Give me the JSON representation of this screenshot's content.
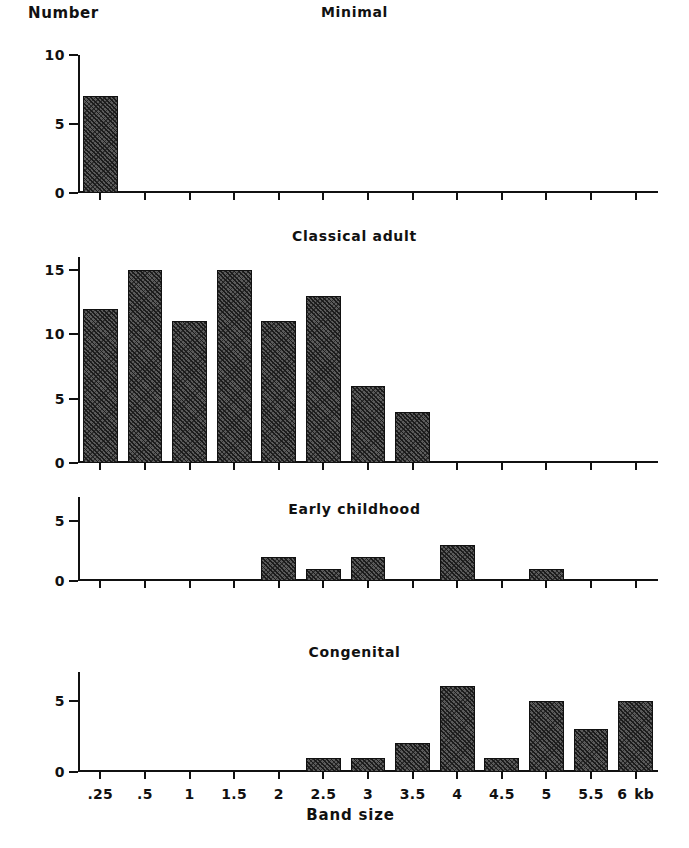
{
  "figure": {
    "y_axis_title": "Number",
    "x_axis_title": "Band size",
    "x_unit": "kb"
  },
  "chart_data": {
    "type": "bar",
    "xlabel": "Band size",
    "ylabel": "Number",
    "x_unit": "kb",
    "grid": false,
    "legend": "none",
    "categories": [
      ".25",
      ".5",
      "1",
      "1.5",
      "2",
      "2.5",
      "3",
      "3.5",
      "4",
      "4.5",
      "5",
      "5.5",
      "6"
    ],
    "panels": [
      {
        "title": "Minimal",
        "ylim": [
          0,
          10
        ],
        "yticks": [
          0,
          5,
          10
        ],
        "ytick_labels": [
          "0",
          "5",
          "10"
        ],
        "values": [
          7,
          0,
          0,
          0,
          0,
          0,
          0,
          0,
          0,
          0,
          0,
          0,
          0
        ]
      },
      {
        "title": "Classical adult",
        "ylim": [
          0,
          16
        ],
        "yticks": [
          0,
          5,
          10,
          15
        ],
        "ytick_labels": [
          "0",
          "5",
          "10",
          "15"
        ],
        "values": [
          12,
          15,
          11,
          15,
          11,
          13,
          6,
          4,
          0,
          0,
          0,
          0,
          0
        ]
      },
      {
        "title": "Early childhood",
        "ylim": [
          0,
          7
        ],
        "yticks": [
          0,
          5
        ],
        "ytick_labels": [
          "0",
          "5"
        ],
        "values": [
          0,
          0,
          0,
          0,
          2,
          1,
          2,
          0,
          3,
          0,
          1,
          0,
          0
        ]
      },
      {
        "title": "Congenital",
        "ylim": [
          0,
          7
        ],
        "yticks": [
          0,
          5
        ],
        "ytick_labels": [
          "0",
          "5"
        ],
        "values": [
          0,
          0,
          0,
          0,
          0,
          1,
          1,
          2,
          6,
          1,
          5,
          3,
          5
        ]
      }
    ],
    "series": [
      {
        "name": "Minimal",
        "values": [
          7,
          0,
          0,
          0,
          0,
          0,
          0,
          0,
          0,
          0,
          0,
          0,
          0
        ]
      },
      {
        "name": "Classical adult",
        "values": [
          12,
          15,
          11,
          15,
          11,
          13,
          6,
          4,
          0,
          0,
          0,
          0,
          0
        ]
      },
      {
        "name": "Early childhood",
        "values": [
          0,
          0,
          0,
          0,
          2,
          1,
          2,
          0,
          3,
          0,
          1,
          0,
          0
        ]
      },
      {
        "name": "Congenital",
        "values": [
          0,
          0,
          0,
          0,
          0,
          1,
          1,
          2,
          6,
          1,
          5,
          3,
          5
        ]
      }
    ],
    "colors": {
      "bar_fill": "#5b5b5b",
      "bar_edge": "#111111",
      "axis": "#111111",
      "background": "#ffffff"
    }
  }
}
